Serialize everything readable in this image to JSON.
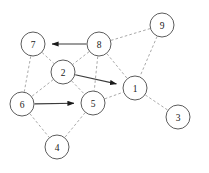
{
  "figure": {
    "width": 209,
    "height": 173,
    "background_color": "#ffffff"
  },
  "style": {
    "node_fill": "#ffffff",
    "node_stroke": "#4a4a4a",
    "node_radius": 12,
    "label_color": "#202020",
    "solid_edge_color": "#3b3b3b",
    "dashed_edge_color": "#9a9a9a",
    "arrowhead_color": "#1a1a1a"
  },
  "graph": {
    "node_count": 9,
    "nodes": [
      {
        "id": "7",
        "label": "7",
        "cx": 33,
        "cy": 44
      },
      {
        "id": "8",
        "label": "8",
        "cx": 99,
        "cy": 44
      },
      {
        "id": "9",
        "label": "9",
        "cx": 162,
        "cy": 25
      },
      {
        "id": "2",
        "label": "2",
        "cx": 63,
        "cy": 72
      },
      {
        "id": "1",
        "label": "1",
        "cx": 135,
        "cy": 88
      },
      {
        "id": "6",
        "label": "6",
        "cx": 22,
        "cy": 104
      },
      {
        "id": "5",
        "label": "5",
        "cx": 93,
        "cy": 103
      },
      {
        "id": "3",
        "label": "3",
        "cx": 178,
        "cy": 117
      },
      {
        "id": "4",
        "label": "4",
        "cx": 57,
        "cy": 147
      }
    ],
    "solid_directed_edges": [
      {
        "from": "8",
        "to": "7"
      },
      {
        "from": "2",
        "to": "1"
      },
      {
        "from": "6",
        "to": "5"
      }
    ],
    "dashed_edges": [
      {
        "from": "8",
        "to": "9"
      },
      {
        "from": "8",
        "to": "2"
      },
      {
        "from": "8",
        "to": "5"
      },
      {
        "from": "8",
        "to": "1"
      },
      {
        "from": "9",
        "to": "1"
      },
      {
        "from": "7",
        "to": "2"
      },
      {
        "from": "7",
        "to": "6"
      },
      {
        "from": "2",
        "to": "6"
      },
      {
        "from": "2",
        "to": "5"
      },
      {
        "from": "5",
        "to": "1"
      },
      {
        "from": "5",
        "to": "4"
      },
      {
        "from": "6",
        "to": "4"
      },
      {
        "from": "1",
        "to": "3"
      }
    ]
  }
}
